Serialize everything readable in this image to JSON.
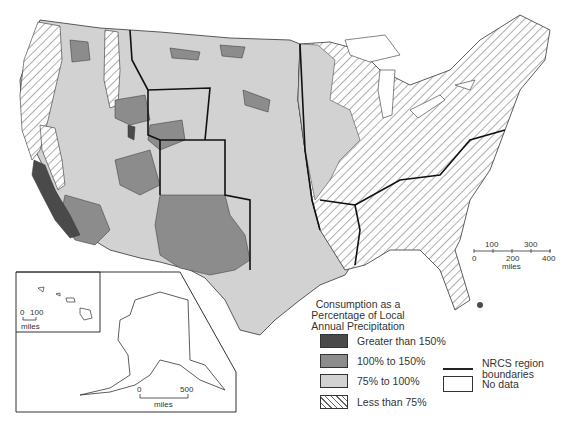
{
  "legend": {
    "title_lines": [
      "Consumption as a",
      "Percentage of Local",
      "Annual Precipitation"
    ],
    "categories": [
      {
        "label": "Greater than 150%",
        "fill": "#4a4a4a"
      },
      {
        "label": "100% to 150%",
        "fill": "#8c8c8c"
      },
      {
        "label": "75% to 100%",
        "fill": "#d2d2d2"
      },
      {
        "label": "Less than 75%",
        "fill": "hatched"
      }
    ],
    "boundary_label_lines": [
      "NRCS region",
      "boundaries"
    ],
    "no_data_label": "No data"
  },
  "scale_main": {
    "ticks_top": [
      "100",
      "300"
    ],
    "ticks_bottom": [
      "0",
      "200",
      "400"
    ],
    "unit": "miles"
  },
  "scale_hawaii": {
    "ticks": [
      "0",
      "100"
    ],
    "unit": "miles"
  },
  "scale_alaska": {
    "ticks": [
      "0",
      "500"
    ],
    "unit": "miles"
  },
  "colors": {
    "dark": "#4a4a4a",
    "mid": "#8c8c8c",
    "light": "#d2d2d2",
    "hatch": "#666666",
    "outline": "#222222"
  }
}
